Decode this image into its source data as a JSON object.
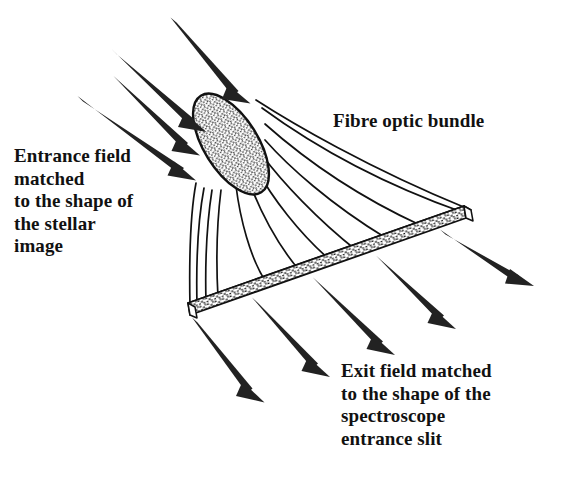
{
  "figure": {
    "background_color": "#ffffff",
    "ink_color": "#111111",
    "width": 561,
    "height": 485
  },
  "labels": {
    "entrance_field": "Entrance field\nmatched\nto the shape of\nthe stellar\nimage",
    "fibre_bundle": "Fibre optic bundle",
    "exit_field": "Exit field matched\nto the shape of the\nspectroscope\nentrance slit"
  },
  "parts": {
    "entrance_face": {
      "name": "entrance-face",
      "shape": "ellipse",
      "fill": "stipple",
      "center": [
        231,
        144
      ],
      "radius_x": 27,
      "radius_y": 57,
      "rotation_deg": -32
    },
    "exit_slit": {
      "name": "exit-slit",
      "shape": "slab",
      "fill": "stipple",
      "left_end": [
        190,
        308
      ],
      "right_end": [
        466,
        212
      ],
      "thickness": 13
    },
    "fibre_lines": {
      "name": "fibre-lines",
      "count": 11
    }
  },
  "arrows": {
    "input": {
      "count": 4,
      "direction": "down-right",
      "description": "incoming stellar beam",
      "segments": [
        [
          172,
          20,
          246,
          100
        ],
        [
          113,
          52,
          201,
          128
        ],
        [
          115,
          79,
          194,
          151
        ],
        [
          79,
          99,
          190,
          176
        ]
      ]
    },
    "output": {
      "count": 5,
      "direction": "down-right",
      "description": "exit beam to spectroscope",
      "segments": [
        [
          194,
          320,
          262,
          400
        ],
        [
          254,
          300,
          327,
          375
        ],
        [
          315,
          280,
          392,
          353
        ],
        [
          378,
          258,
          453,
          327
        ],
        [
          442,
          232,
          528,
          285
        ]
      ]
    }
  }
}
